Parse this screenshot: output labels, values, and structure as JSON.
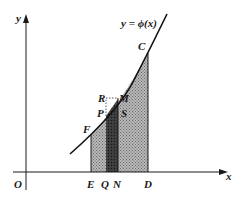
{
  "diagram": {
    "type": "area-under-curve",
    "curve_label": "y = ϕ(x)",
    "axes": {
      "x_label": "x",
      "y_label": "y",
      "origin_label": "O"
    },
    "points": {
      "C": "C",
      "F": "F",
      "R": "R",
      "M": "M",
      "P": "P",
      "S": "S",
      "E": "E",
      "Q": "Q",
      "N": "N",
      "D": "D"
    },
    "regions": [
      {
        "name": "EFCD",
        "shading": "light-gray"
      },
      {
        "name": "QPMN",
        "shading": "dark-gray"
      }
    ],
    "colors": {
      "line": "#1a1a1a",
      "light_fill": "#9a9a9a",
      "dark_fill": "#3a3a3a"
    }
  }
}
